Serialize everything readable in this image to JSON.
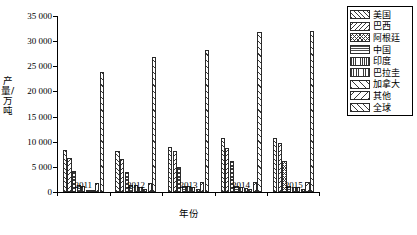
{
  "chart_data": {
    "type": "bar",
    "title": "",
    "xlabel": "年份",
    "ylabel": "产量/万吨",
    "ylim": [
      0,
      35000
    ],
    "yticks": [
      0,
      5000,
      10000,
      15000,
      20000,
      25000,
      30000,
      35000
    ],
    "ytick_labels": [
      "0",
      "5 000",
      "10 000",
      "15 000",
      "20 000",
      "25 000",
      "30 000",
      "35 000"
    ],
    "grid": false,
    "legend_position": "right",
    "categories": [
      "2011",
      "2012",
      "2013",
      "2014",
      "2015"
    ],
    "series": [
      {
        "name": "美国",
        "values": [
          8405,
          8206,
          8951,
          10683,
          10686
        ]
      },
      {
        "name": "巴西",
        "values": [
          6685,
          6555,
          8150,
          8670,
          9650
        ]
      },
      {
        "name": "阿根廷",
        "values": [
          4100,
          4010,
          4930,
          6140,
          6150
        ]
      },
      {
        "name": "中国",
        "values": [
          1450,
          1300,
          1220,
          1220,
          1180
        ]
      },
      {
        "name": "印度",
        "values": [
          1200,
          1460,
          1190,
          1030,
          920
        ]
      },
      {
        "name": "巴拉圭",
        "values": [
          420,
          910,
          930,
          820,
          900
        ]
      },
      {
        "name": "加拿大",
        "values": [
          430,
          520,
          540,
          610,
          630
        ]
      },
      {
        "name": "其他",
        "values": [
          1720,
          1850,
          1900,
          1920,
          2010
        ]
      },
      {
        "name": "全球",
        "values": [
          23830,
          26800,
          28180,
          31800,
          31930
        ]
      }
    ]
  },
  "legend": {
    "entries": [
      {
        "label": "美国",
        "pattern": "diagonal-forward"
      },
      {
        "label": "巴西",
        "pattern": "diagonal-backward"
      },
      {
        "label": "阿根廷",
        "pattern": "cross-hatch"
      },
      {
        "label": "中国",
        "pattern": "horizontal-lines"
      },
      {
        "label": "印度",
        "pattern": "vertical-lines-dense"
      },
      {
        "label": "巴拉圭",
        "pattern": "vertical-lines"
      },
      {
        "label": "加拿大",
        "pattern": "diagonal-forward-wide"
      },
      {
        "label": "其他",
        "pattern": "diagonal-backward-wide"
      },
      {
        "label": "全球",
        "pattern": "diagonal-global"
      }
    ]
  },
  "colors": {
    "axis": "#000000",
    "hatch": "#3a3a3a",
    "bar_fill": "#ffffff",
    "background": "#ffffff"
  }
}
